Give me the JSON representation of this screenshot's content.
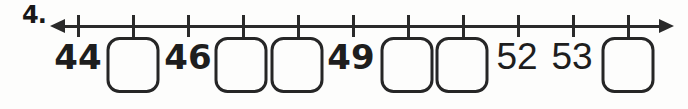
{
  "worksheet": {
    "problem_number": "4.",
    "number_line": {
      "tick_count": 11,
      "range_start_label": "44",
      "range_end_label": "53",
      "items": [
        {
          "kind": "number",
          "text": "44"
        },
        {
          "kind": "answer-box",
          "text": ""
        },
        {
          "kind": "number",
          "text": "46"
        },
        {
          "kind": "answer-box",
          "text": ""
        },
        {
          "kind": "answer-box",
          "text": ""
        },
        {
          "kind": "number",
          "text": "49"
        },
        {
          "kind": "answer-box",
          "text": ""
        },
        {
          "kind": "answer-box",
          "text": ""
        },
        {
          "kind": "number",
          "text": "52"
        },
        {
          "kind": "number",
          "text": "53"
        },
        {
          "kind": "answer-box",
          "text": ""
        }
      ]
    }
  },
  "colors": {
    "ink": "#2a2a2a",
    "number_ink": "#1e1e1e",
    "paper": "#fdfdfc"
  }
}
